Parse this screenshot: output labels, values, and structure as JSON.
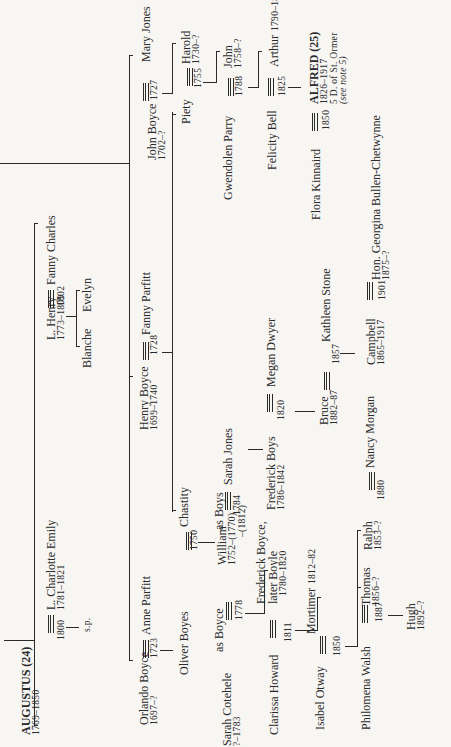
{
  "tree": {
    "augustus": {
      "name": "AUGUSTUS",
      "ref": "(24)",
      "dates": "1769–1850"
    },
    "charlotte": {
      "name": "L. Charlotte Emily",
      "dates": "1781–1821"
    },
    "m_augustus": {
      "year": "1800"
    },
    "sp": "s.p.",
    "lhenry": {
      "name": "L. Henry",
      "dates": "1773–1809"
    },
    "fanny_charles": {
      "name": "Fanny Charles"
    },
    "m_henry": {
      "year": "1802"
    },
    "blanche": {
      "name": "Blanche"
    },
    "evelyn": {
      "name": "Evelyn"
    },
    "orlando": {
      "name": "Orlando Boyce",
      "dates": "1697–?"
    },
    "anne_parfitt": {
      "name": "Anne Parfitt"
    },
    "m_orlando": {
      "year": "1723"
    },
    "oliver": {
      "name": "Oliver Boyes"
    },
    "chastity": {
      "name": "Chastity"
    },
    "m_oliver": {
      "year": "1750"
    },
    "william": {
      "name": "William",
      "dates": "1752–(1770)",
      "dates2": "–(1812)"
    },
    "sarah_cotehele": {
      "name": "Sarah Cotehele",
      "dates": "?–1783"
    },
    "as_boyce": "as Boyce",
    "m_sarah": {
      "year": "1778"
    },
    "frederick_boyce": {
      "name": "Frederick Boyce,",
      "name2": "later Boyle",
      "dates": "1780–1820"
    },
    "clarissa": {
      "name": "Clarissa Howard"
    },
    "m_clarissa": {
      "year": "1811"
    },
    "mortimer": {
      "name": "Mortimer",
      "dates": "1812–82"
    },
    "isabel": {
      "name": "Isabel Otway"
    },
    "m_isabel": {
      "year": "1850"
    },
    "thomas": {
      "name": "Thomas",
      "dates": "1856–?"
    },
    "ralph": {
      "name": "Ralph",
      "dates": "1853–?"
    },
    "philomena": {
      "name": "Philomena Walsh"
    },
    "m_philomena": {
      "year": "1887"
    },
    "hugh": {
      "name": "Hugh",
      "dates": "1892–?"
    },
    "nancy_morgan": {
      "name": "Nancy Morgan"
    },
    "m_ralph": {
      "year": "1880"
    },
    "henry_boyce": {
      "name": "Henry Boyce",
      "dates": "1699–1740"
    },
    "fanny_parfitt": {
      "name": "Fanny Parfitt"
    },
    "m_henry_boyce": {
      "year": "1728"
    },
    "as_boys": "as Boys",
    "sarah_jones": {
      "name": "Sarah Jones"
    },
    "m_william": {
      "year": "1784"
    },
    "frederick_boys": {
      "name": "Frederick Boys",
      "dates": "1786–1842"
    },
    "megan": {
      "name": "Megan Dwyer"
    },
    "m_frederick_boys": {
      "year": "1820"
    },
    "bruce": {
      "name": "Bruce",
      "dates": "1882–87"
    },
    "kathleen": {
      "name": "Kathleen Stone"
    },
    "m_kathleen": {
      "year": "1857"
    },
    "campbell": {
      "name": "Campbell",
      "dates": "1865–1917"
    },
    "georgina": {
      "name": "Hon. Georgina Bullen-Chetwynne",
      "dates": "1875–?"
    },
    "m_campbell": {
      "year": "1901"
    },
    "john_boyce": {
      "name": "John Boyce",
      "dates": "1702–?"
    },
    "mary_jones": {
      "name": "Mary Jones"
    },
    "m_john": {
      "year": "1727"
    },
    "piety": {
      "name": "Piety"
    },
    "harold": {
      "name": "Harold",
      "dates": "1730–?"
    },
    "m_piety": {
      "year": "1755"
    },
    "gwendolen": {
      "name": "Gwendolen Parry"
    },
    "john": {
      "name": "John",
      "dates": "1758–?"
    },
    "m_john2": {
      "year": "1788"
    },
    "felicity": {
      "name": "Felicity Bell"
    },
    "arthur": {
      "name": "Arthur",
      "dates": "1790–1830"
    },
    "m_felicity": {
      "year": "1825"
    },
    "flora": {
      "name": "Flora Kinnaird"
    },
    "alfred": {
      "name": "ALFRED",
      "ref": "(25)",
      "dates": "1826–1917",
      "title": "5 D. of St. Ormer",
      "note": "(see note 5)"
    },
    "m_flora": {
      "year": "1850"
    }
  }
}
